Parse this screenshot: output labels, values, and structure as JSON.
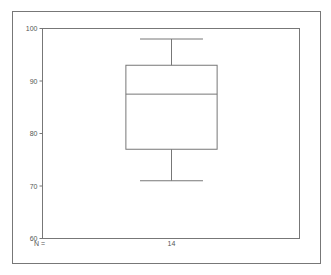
{
  "chart_data": {
    "type": "boxplot",
    "title": "",
    "xlabel": "",
    "ylabel": "",
    "ylim": [
      60,
      100
    ],
    "yticks": [
      60,
      70,
      80,
      90,
      100
    ],
    "n_label": "N =",
    "boxes": [
      {
        "category": "",
        "n": "14",
        "whisker_low": 71,
        "q1": 77,
        "median": 87.5,
        "q3": 93,
        "whisker_high": 98
      }
    ],
    "grid": false,
    "colors": {
      "frame": "#666666",
      "box": "#777777"
    }
  }
}
